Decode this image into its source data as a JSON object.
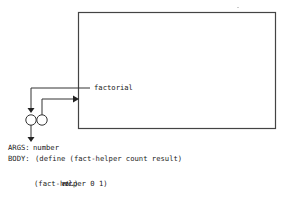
{
  "diagram": {
    "procedure_box": {
      "label": "factorial"
    },
    "args": {
      "label": "ARGS:",
      "value": "number"
    },
    "body": {
      "label": "BODY:",
      "line1": "(define (fact-helper count result)",
      "line2_italic": "etc.",
      "line2_close": ")",
      "line3": "(fact-helper 0 1)"
    },
    "colors": {
      "stroke": "#333333",
      "text": "#222222",
      "background": "#ffffff"
    }
  }
}
